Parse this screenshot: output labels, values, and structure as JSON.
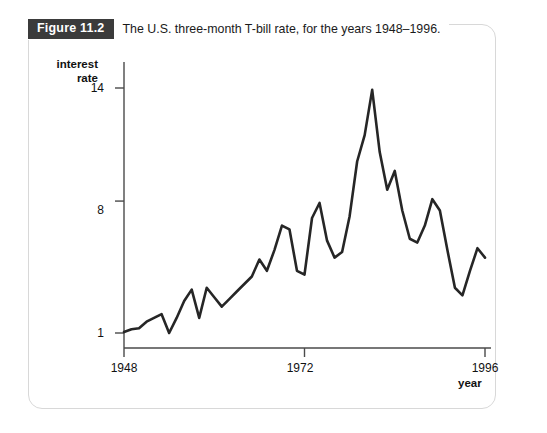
{
  "figure": {
    "badge_label": "Figure 11.2",
    "caption": "The U.S. three-month T-bill rate, for the years 1948–1996."
  },
  "chart_data": {
    "type": "line",
    "title": "The U.S. three-month T-bill rate, for the years 1948–1996.",
    "xlabel": "year",
    "ylabel": "interest rate",
    "xlim": [
      1948,
      1996
    ],
    "ylim": [
      1,
      14
    ],
    "grid": false,
    "legend": null,
    "x_ticks": [
      1948,
      1972,
      1996
    ],
    "x_tick_labels": [
      "1948",
      "1972",
      "1996"
    ],
    "y_ticks": [
      1,
      8,
      14
    ],
    "y_tick_labels": [
      "1",
      "8",
      "14"
    ],
    "line_color": "#262626",
    "x": [
      1948,
      1949,
      1950,
      1951,
      1952,
      1953,
      1954,
      1955,
      1956,
      1957,
      1958,
      1959,
      1960,
      1961,
      1962,
      1963,
      1964,
      1965,
      1966,
      1967,
      1968,
      1969,
      1970,
      1971,
      1972,
      1973,
      1974,
      1975,
      1976,
      1977,
      1978,
      1979,
      1980,
      1981,
      1982,
      1983,
      1984,
      1985,
      1986,
      1987,
      1988,
      1989,
      1990,
      1991,
      1992,
      1993,
      1994,
      1995,
      1996
    ],
    "values": [
      1.05,
      1.2,
      1.25,
      1.6,
      1.8,
      2.0,
      1.0,
      1.8,
      2.7,
      3.3,
      1.8,
      3.4,
      2.9,
      2.4,
      2.8,
      3.2,
      3.6,
      4.0,
      4.9,
      4.3,
      5.4,
      6.7,
      6.5,
      4.3,
      4.1,
      7.1,
      7.9,
      5.9,
      5.0,
      5.3,
      7.2,
      10.1,
      11.5,
      13.9,
      10.6,
      8.6,
      9.6,
      7.5,
      6.0,
      5.8,
      6.7,
      8.1,
      7.5,
      5.4,
      3.4,
      3.0,
      4.3,
      5.5,
      5.0
    ],
    "annotations": []
  }
}
